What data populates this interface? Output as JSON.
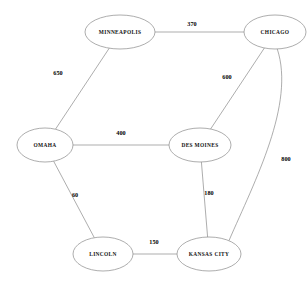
{
  "diagram": {
    "type": "weighted-undirected-graph",
    "title": "",
    "canvas": {
      "width": 308,
      "height": 286,
      "background": "#ffffff"
    },
    "style": {
      "edge_color": "#8a8a8a",
      "node_fill": "#ffffff",
      "node_stroke": "#8a8a8a",
      "label_color": "#111111"
    },
    "nodes": [
      {
        "id": "minneapolis",
        "label": "MINNEAPOLIS",
        "cx": 120,
        "cy": 32,
        "rx": 35,
        "ry": 17
      },
      {
        "id": "chicago",
        "label": "CHICAGO",
        "cx": 275,
        "cy": 32,
        "rx": 31,
        "ry": 17
      },
      {
        "id": "omaha",
        "label": "OMAHA",
        "cx": 45,
        "cy": 145,
        "rx": 28,
        "ry": 17
      },
      {
        "id": "des_moines",
        "label": "DES  MOINES",
        "cx": 200,
        "cy": 145,
        "rx": 31,
        "ry": 17
      },
      {
        "id": "lincoln",
        "label": "LINCOLN",
        "cx": 103,
        "cy": 254,
        "rx": 30,
        "ry": 17
      },
      {
        "id": "kansas_city",
        "label": "KANSAS CITY",
        "cx": 209,
        "cy": 254,
        "rx": 32,
        "ry": 17
      }
    ],
    "edges": [
      {
        "from": "minneapolis",
        "to": "chicago",
        "weight": "370",
        "label_x": 192,
        "label_y": 25
      },
      {
        "from": "minneapolis",
        "to": "omaha",
        "weight": "650",
        "label_x": 58,
        "label_y": 74
      },
      {
        "from": "chicago",
        "to": "des_moines",
        "weight": "600",
        "label_x": 227,
        "label_y": 78
      },
      {
        "from": "chicago",
        "to": "kansas_city",
        "weight": "800",
        "label_x": 286,
        "label_y": 160,
        "curved": true
      },
      {
        "from": "omaha",
        "to": "des_moines",
        "weight": "400",
        "label_x": 121,
        "label_y": 134
      },
      {
        "from": "omaha",
        "to": "lincoln",
        "weight": "60",
        "label_x": 75,
        "label_y": 196
      },
      {
        "from": "des_moines",
        "to": "kansas_city",
        "weight": "180",
        "label_x": 209,
        "label_y": 194
      },
      {
        "from": "lincoln",
        "to": "kansas_city",
        "weight": "150",
        "label_x": 154,
        "label_y": 243
      }
    ]
  },
  "chart_data": {
    "type": "diagram",
    "nodes": [
      "MINNEAPOLIS",
      "CHICAGO",
      "OMAHA",
      "DES MOINES",
      "LINCOLN",
      "KANSAS CITY"
    ],
    "links": [
      {
        "source": "MINNEAPOLIS",
        "target": "CHICAGO",
        "value": 370
      },
      {
        "source": "MINNEAPOLIS",
        "target": "OMAHA",
        "value": 650
      },
      {
        "source": "CHICAGO",
        "target": "DES MOINES",
        "value": 600
      },
      {
        "source": "CHICAGO",
        "target": "KANSAS CITY",
        "value": 800
      },
      {
        "source": "OMAHA",
        "target": "DES MOINES",
        "value": 400
      },
      {
        "source": "OMAHA",
        "target": "LINCOLN",
        "value": 60
      },
      {
        "source": "DES MOINES",
        "target": "KANSAS CITY",
        "value": 180
      },
      {
        "source": "LINCOLN",
        "target": "KANSAS CITY",
        "value": 150
      }
    ]
  }
}
